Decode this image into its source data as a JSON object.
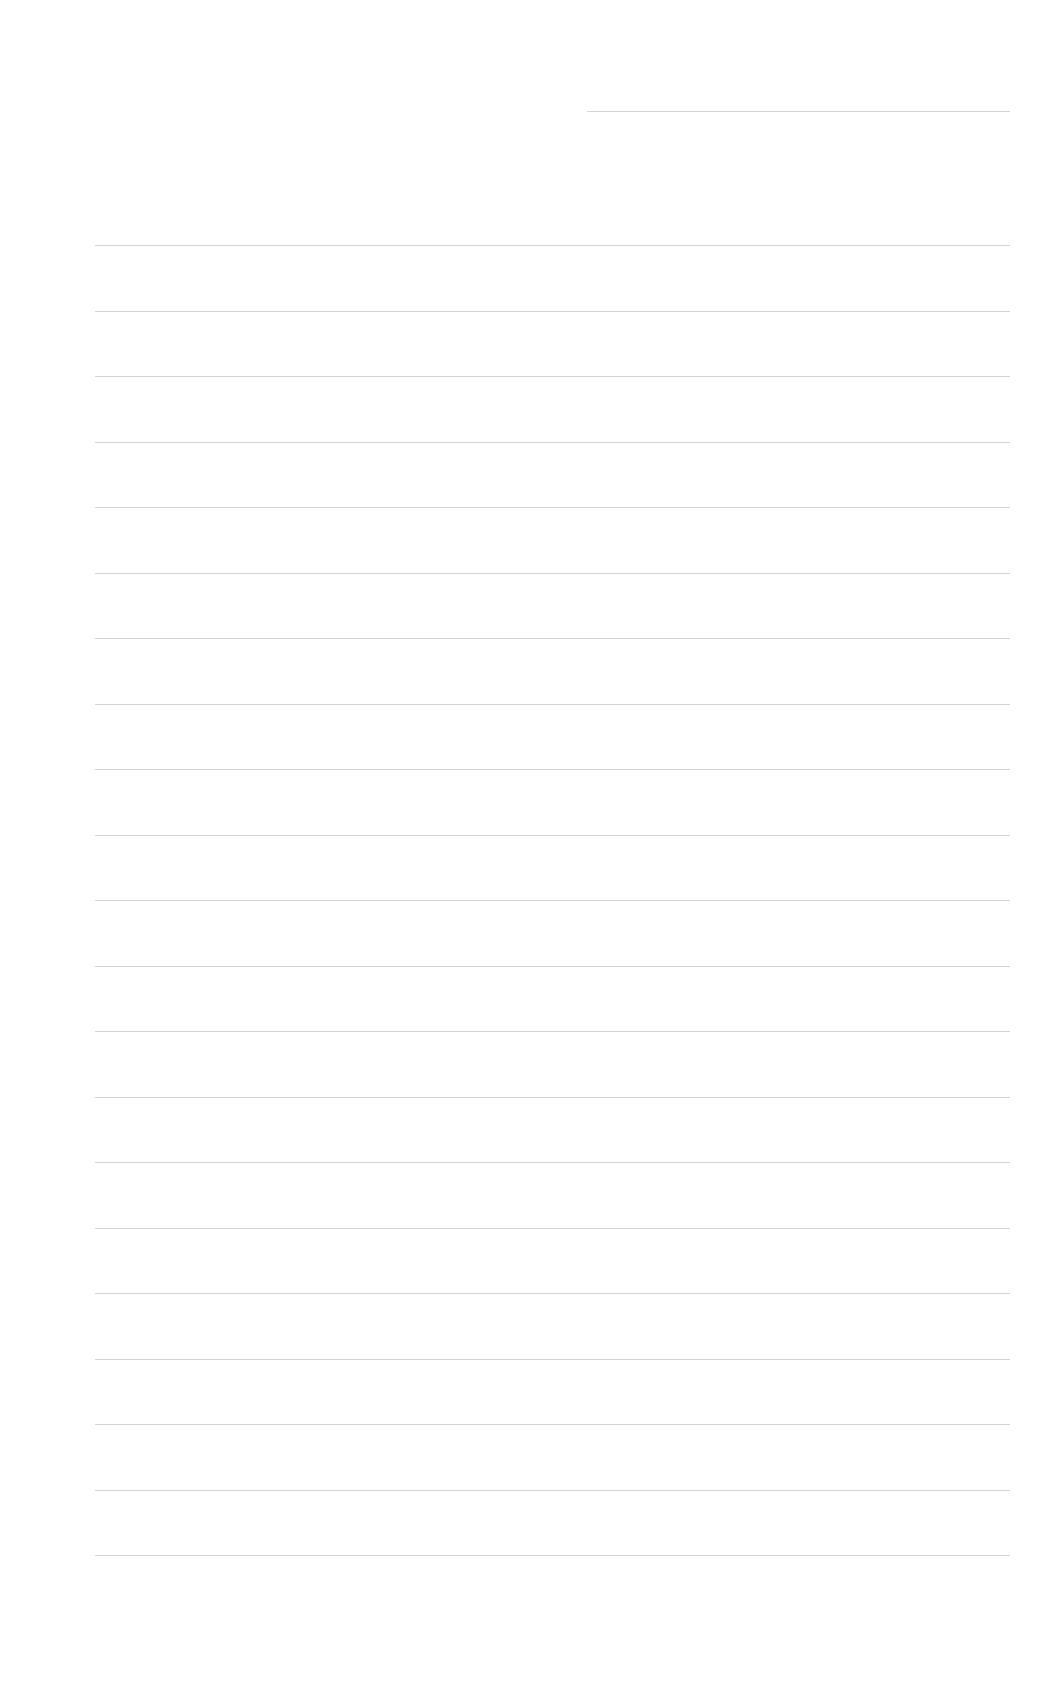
{
  "page": {
    "type": "blank lined form",
    "header_line": {
      "x": 587,
      "y": 111,
      "width": 423
    },
    "lines": {
      "x": 95,
      "width": 915,
      "start_y": 245,
      "spacing": 65.5,
      "count": 21
    },
    "line_color": "#c8c8c8",
    "background": "#ffffff"
  }
}
